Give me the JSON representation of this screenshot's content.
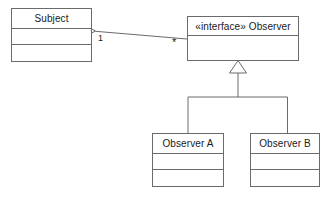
{
  "diagram": {
    "stroke_color": "#6b6b6b",
    "text_color": "#1a1a1a",
    "background_color": "#ffffff",
    "classes": [
      {
        "id": "subject",
        "name": "Subject",
        "stereotype": "",
        "compartments": [
          "",
          ""
        ]
      },
      {
        "id": "observer",
        "name": "Observer",
        "stereotype": "«interface»",
        "full_header": "«interface» Observer",
        "compartments": [
          ""
        ]
      },
      {
        "id": "observer-a",
        "name": "Observer A",
        "stereotype": "",
        "compartments": [
          "",
          ""
        ]
      },
      {
        "id": "observer-b",
        "name": "Observer B",
        "stereotype": "",
        "compartments": [
          "",
          ""
        ]
      }
    ],
    "relationships": [
      {
        "id": "subject-observes",
        "type": "aggregation",
        "from": "Subject",
        "to": "Observer",
        "source_multiplicity": "1",
        "target_multiplicity": "*"
      },
      {
        "id": "observer-a-generalization",
        "type": "generalization",
        "from": "Observer A",
        "to": "Observer"
      },
      {
        "id": "observer-b-generalization",
        "type": "generalization",
        "from": "Observer B",
        "to": "Observer"
      }
    ]
  }
}
